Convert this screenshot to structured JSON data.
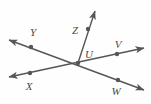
{
  "figure": {
    "width": 151,
    "height": 104,
    "background_color": "#fefefe",
    "stroke_color": "#565656",
    "label_color": "#4a4a4a",
    "stroke_width": 1.4,
    "dot_radius": 2.2
  },
  "points": {
    "U": {
      "label": "U",
      "x": 78,
      "y": 63,
      "label_x": 89,
      "label_y": 54,
      "has_dot": true
    },
    "Y": {
      "label": "Y",
      "x": 31,
      "y": 47,
      "label_x": 33,
      "label_y": 32,
      "has_dot": true
    },
    "X": {
      "label": "X",
      "x": 30,
      "y": 73,
      "label_x": 29,
      "label_y": 86,
      "has_dot": true
    },
    "V": {
      "label": "V",
      "x": 117,
      "y": 54,
      "label_x": 118,
      "label_y": 44,
      "has_dot": true
    },
    "W": {
      "label": "W",
      "x": 118,
      "y": 80,
      "label_x": 116,
      "label_y": 91,
      "has_dot": true
    },
    "Z": {
      "label": "Z",
      "x": 88,
      "y": 29,
      "label_x": 75,
      "label_y": 30,
      "has_dot": true
    }
  },
  "lines": [
    {
      "name": "line-YW",
      "description": "Line through Y, U and W with arrowheads at both ends",
      "from_x": 9,
      "from_y": 40,
      "to_x": 144,
      "to_y": 90,
      "arrow_start": true,
      "arrow_end": true
    },
    {
      "name": "line-XV",
      "description": "Line through X, U and V with arrowheads at both ends",
      "from_x": 9,
      "from_y": 77,
      "to_x": 144,
      "to_y": 48,
      "arrow_start": true,
      "arrow_end": true
    },
    {
      "name": "ray-UZ",
      "description": "Ray from U through Z with arrowhead at far end",
      "from_x": 78,
      "from_y": 63,
      "to_x": 95,
      "to_y": 11,
      "arrow_start": false,
      "arrow_end": true
    }
  ],
  "labels_order": [
    "Y",
    "Z",
    "V",
    "U",
    "X",
    "W"
  ]
}
